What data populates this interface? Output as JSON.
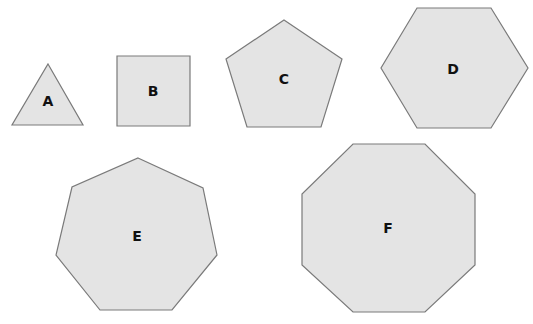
{
  "diagram": {
    "fill_color": "#e4e4e4",
    "stroke_color": "#7a7a7a",
    "shapes": [
      {
        "label": "A",
        "name": "triangle",
        "sides": 3,
        "points": "48,64 83,125 12,125",
        "label_pos": [
          48,
          101
        ]
      },
      {
        "label": "B",
        "name": "square",
        "sides": 4,
        "points": "117,56 190,56 190,126 117,126",
        "label_pos": [
          153,
          91
        ]
      },
      {
        "label": "C",
        "name": "pentagon",
        "sides": 5,
        "points": "284,20 342,59 321,127 247,127 226,59",
        "label_pos": [
          284,
          79
        ]
      },
      {
        "label": "D",
        "name": "hexagon",
        "sides": 6,
        "points": "417,8 491,8 528,68 491,128 417,128 381,68",
        "label_pos": [
          453,
          69
        ]
      },
      {
        "label": "E",
        "name": "heptagon",
        "sides": 7,
        "points": "138,158 203,188 217,255 172,310 100,310 56,255 72,187",
        "label_pos": [
          137,
          236
        ]
      },
      {
        "label": "F",
        "name": "octagon",
        "sides": 8,
        "points": "353,144 425,144 475,194 475,265 425,312 353,312 302,265 302,194",
        "label_pos": [
          388,
          228
        ]
      }
    ]
  }
}
